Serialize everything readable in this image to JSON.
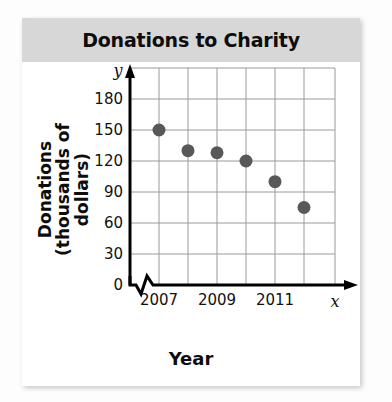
{
  "title": "Donations to Charity",
  "axis_titles": {
    "y_line1": "Donations",
    "y_line2": "(thousands of dollars)",
    "x": "Year",
    "y_var": "y",
    "x_var": "x"
  },
  "chart_data": {
    "type": "scatter",
    "title": "Donations to Charity",
    "xlabel": "Year",
    "ylabel": "Donations (thousands of dollars)",
    "x": [
      2007,
      2008,
      2009,
      2010,
      2011,
      2012
    ],
    "values": [
      150,
      130,
      128,
      120,
      100,
      75
    ],
    "xtick_labels": [
      "2007",
      "",
      "2009",
      "",
      "2011",
      ""
    ],
    "ytick_labels": [
      "0",
      "30",
      "60",
      "90",
      "120",
      "150",
      "180"
    ],
    "yticks": [
      0,
      30,
      60,
      90,
      120,
      150,
      180
    ],
    "ylim": [
      0,
      195
    ],
    "xlim": [
      2006.5,
      2013
    ],
    "grid": true,
    "legend": false,
    "axis_break_x": true,
    "point_color": "#585858",
    "grid_color": "#9a9a9a",
    "axis_color": "#000000"
  }
}
